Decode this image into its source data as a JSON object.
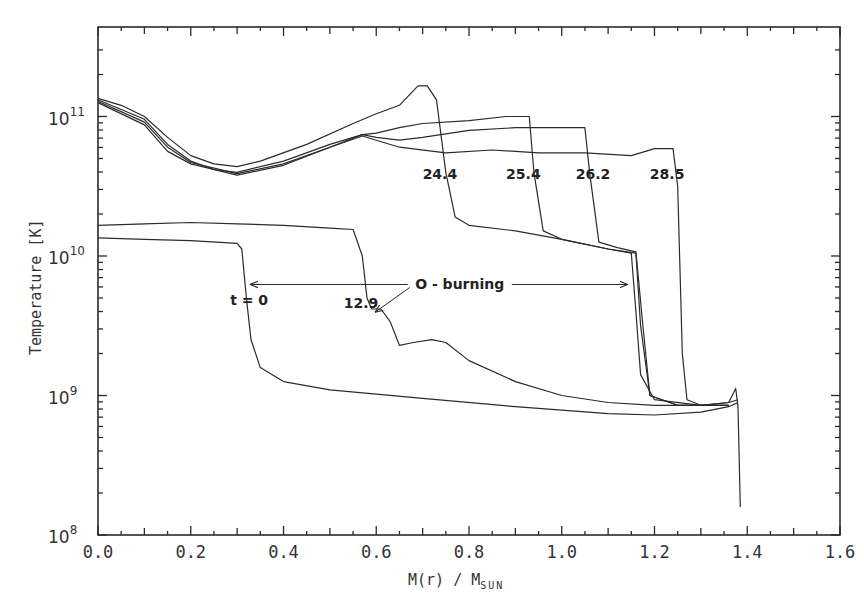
{
  "chart_data": {
    "type": "line",
    "title": "",
    "xlabel": "M(r) / M_SUN",
    "xlabel_main": "M(r) / M",
    "xlabel_sub": "SUN",
    "ylabel": "Temperature [K]",
    "xlim": [
      0.0,
      1.6
    ],
    "ylim": [
      100000000.0,
      350000000000.0
    ],
    "yscale": "log",
    "x_ticks": [
      "0.0",
      "0.2",
      "0.4",
      "0.6",
      "0.8",
      "1.0",
      "1.2",
      "1.4",
      "1.6"
    ],
    "y_ticks": [
      {
        "base": "10",
        "exp": "8",
        "value": 100000000.0
      },
      {
        "base": "10",
        "exp": "9",
        "value": 1000000000.0
      },
      {
        "base": "10",
        "exp": "10",
        "value": 10000000000.0
      },
      {
        "base": "10",
        "exp": "11",
        "value": 100000000000.0
      }
    ],
    "grid": false,
    "legend": "none (curves labeled inline)",
    "series": [
      {
        "name": "t = 0",
        "label": "t = 0",
        "points_log10T": [
          [
            0.0,
            10.13
          ],
          [
            0.1,
            10.12
          ],
          [
            0.2,
            10.11
          ],
          [
            0.3,
            10.09
          ],
          [
            0.31,
            10.05
          ],
          [
            0.32,
            9.7
          ],
          [
            0.33,
            9.4
          ],
          [
            0.35,
            9.2
          ],
          [
            0.4,
            9.1
          ],
          [
            0.5,
            9.04
          ],
          [
            0.7,
            8.98
          ],
          [
            0.9,
            8.92
          ],
          [
            1.1,
            8.87
          ],
          [
            1.2,
            8.86
          ],
          [
            1.3,
            8.88
          ],
          [
            1.36,
            8.92
          ],
          [
            1.38,
            8.95
          ]
        ]
      },
      {
        "name": "12.9",
        "label": "12.9",
        "points_log10T": [
          [
            0.0,
            10.22
          ],
          [
            0.1,
            10.23
          ],
          [
            0.2,
            10.24
          ],
          [
            0.3,
            10.23
          ],
          [
            0.4,
            10.22
          ],
          [
            0.5,
            10.2
          ],
          [
            0.55,
            10.19
          ],
          [
            0.57,
            10.0
          ],
          [
            0.58,
            9.7
          ],
          [
            0.59,
            9.62
          ],
          [
            0.61,
            9.62
          ],
          [
            0.63,
            9.53
          ],
          [
            0.65,
            9.36
          ],
          [
            0.68,
            9.38
          ],
          [
            0.72,
            9.4
          ],
          [
            0.75,
            9.38
          ],
          [
            0.8,
            9.25
          ],
          [
            0.9,
            9.1
          ],
          [
            1.0,
            9.0
          ],
          [
            1.1,
            8.95
          ],
          [
            1.2,
            8.93
          ],
          [
            1.3,
            8.93
          ],
          [
            1.36,
            8.95
          ],
          [
            1.38,
            8.97
          ]
        ]
      },
      {
        "name": "24.4",
        "label": "24.4",
        "points_log10T": [
          [
            0.0,
            11.13
          ],
          [
            0.05,
            11.08
          ],
          [
            0.1,
            11.0
          ],
          [
            0.15,
            10.85
          ],
          [
            0.2,
            10.72
          ],
          [
            0.25,
            10.66
          ],
          [
            0.3,
            10.64
          ],
          [
            0.35,
            10.68
          ],
          [
            0.45,
            10.8
          ],
          [
            0.55,
            10.95
          ],
          [
            0.6,
            11.02
          ],
          [
            0.65,
            11.08
          ],
          [
            0.69,
            11.22
          ],
          [
            0.71,
            11.22
          ],
          [
            0.73,
            11.12
          ],
          [
            0.75,
            10.6
          ],
          [
            0.77,
            10.28
          ],
          [
            0.8,
            10.22
          ],
          [
            0.9,
            10.18
          ],
          [
            1.0,
            10.12
          ],
          [
            1.1,
            10.05
          ],
          [
            1.15,
            10.02
          ],
          [
            1.16,
            9.6
          ],
          [
            1.17,
            9.15
          ],
          [
            1.2,
            8.97
          ],
          [
            1.3,
            8.93
          ],
          [
            1.36,
            8.95
          ],
          [
            1.375,
            9.05
          ],
          [
            1.38,
            8.92
          ],
          [
            1.385,
            8.2
          ]
        ]
      },
      {
        "name": "25.4",
        "label": "25.4",
        "points_log10T": [
          [
            0.0,
            11.12
          ],
          [
            0.1,
            10.98
          ],
          [
            0.15,
            10.8
          ],
          [
            0.2,
            10.68
          ],
          [
            0.25,
            10.62
          ],
          [
            0.3,
            10.6
          ],
          [
            0.4,
            10.68
          ],
          [
            0.5,
            10.8
          ],
          [
            0.57,
            10.87
          ],
          [
            0.6,
            10.88
          ],
          [
            0.65,
            10.92
          ],
          [
            0.7,
            10.95
          ],
          [
            0.8,
            10.97
          ],
          [
            0.88,
            11.0
          ],
          [
            0.93,
            11.0
          ],
          [
            0.94,
            10.6
          ],
          [
            0.96,
            10.18
          ],
          [
            1.0,
            10.12
          ],
          [
            1.1,
            10.05
          ],
          [
            1.16,
            10.02
          ],
          [
            1.17,
            9.5
          ],
          [
            1.19,
            9.0
          ],
          [
            1.25,
            8.93
          ],
          [
            1.36,
            8.93
          ]
        ]
      },
      {
        "name": "26.2",
        "label": "26.2",
        "points_log10T": [
          [
            0.0,
            11.11
          ],
          [
            0.1,
            10.96
          ],
          [
            0.15,
            10.78
          ],
          [
            0.2,
            10.67
          ],
          [
            0.3,
            10.59
          ],
          [
            0.4,
            10.66
          ],
          [
            0.5,
            10.78
          ],
          [
            0.57,
            10.87
          ],
          [
            0.6,
            10.85
          ],
          [
            0.65,
            10.83
          ],
          [
            0.7,
            10.85
          ],
          [
            0.8,
            10.9
          ],
          [
            0.9,
            10.92
          ],
          [
            1.05,
            10.92
          ],
          [
            1.06,
            10.6
          ],
          [
            1.08,
            10.1
          ],
          [
            1.12,
            10.06
          ],
          [
            1.16,
            10.03
          ],
          [
            1.175,
            9.5
          ],
          [
            1.19,
            9.0
          ],
          [
            1.25,
            8.93
          ],
          [
            1.36,
            8.93
          ]
        ]
      },
      {
        "name": "28.5",
        "label": "28.5",
        "points_log10T": [
          [
            0.0,
            11.1
          ],
          [
            0.1,
            10.94
          ],
          [
            0.15,
            10.75
          ],
          [
            0.2,
            10.66
          ],
          [
            0.3,
            10.58
          ],
          [
            0.4,
            10.65
          ],
          [
            0.5,
            10.78
          ],
          [
            0.57,
            10.86
          ],
          [
            0.65,
            10.78
          ],
          [
            0.75,
            10.74
          ],
          [
            0.85,
            10.76
          ],
          [
            0.95,
            10.74
          ],
          [
            1.05,
            10.74
          ],
          [
            1.15,
            10.72
          ],
          [
            1.2,
            10.77
          ],
          [
            1.24,
            10.77
          ],
          [
            1.25,
            10.5
          ],
          [
            1.26,
            9.3
          ],
          [
            1.27,
            8.97
          ],
          [
            1.3,
            8.93
          ],
          [
            1.36,
            8.93
          ]
        ]
      }
    ],
    "annotations": [
      {
        "text": "t = 0",
        "x": 0.285,
        "log10T": 9.65
      },
      {
        "text": "12.9",
        "x": 0.53,
        "log10T": 9.63
      },
      {
        "text": "24.4",
        "x": 0.7,
        "log10T": 10.55
      },
      {
        "text": "25.4",
        "x": 0.88,
        "log10T": 10.55
      },
      {
        "text": "26.2",
        "x": 1.03,
        "log10T": 10.55
      },
      {
        "text": "28.5",
        "x": 1.19,
        "log10T": 10.55
      },
      {
        "text": "O - burning",
        "x": 0.78,
        "log10T": 9.76,
        "arrows": [
          {
            "from": 0.69,
            "to": 0.325
          },
          {
            "from": 0.87,
            "to": 1.145
          },
          {
            "to_x": 0.59,
            "to_log10T": 9.6
          }
        ]
      }
    ]
  }
}
